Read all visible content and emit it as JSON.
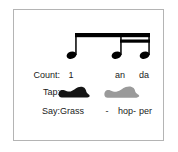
{
  "figure": {
    "border_color": "#b4b4b4",
    "background_color": "#ffffff",
    "ink_color": "#1a1a1a"
  },
  "notation": {
    "type": "beamed-rhythm-group",
    "description": "One eighth note beamed to two sixteenth notes",
    "beam_color": "#000000",
    "notes": [
      {
        "name": "eighth-note",
        "beams": 1,
        "x": 75,
        "label": "1"
      },
      {
        "name": "sixteenth-note",
        "beams": 2,
        "x": 120,
        "label": "an"
      },
      {
        "name": "sixteenth-note",
        "beams": 2,
        "x": 145,
        "label": "da"
      }
    ]
  },
  "rows": {
    "count": {
      "label": "Count:",
      "values": [
        "1",
        "an",
        "da"
      ]
    },
    "tap": {
      "label": "Tap:",
      "shoes": [
        {
          "name": "tap-shoe-black",
          "color": "#141414"
        },
        {
          "name": "tap-shoe-gray",
          "color": "#9a9a9a"
        }
      ]
    },
    "say": {
      "label": "Say:",
      "words": [
        "Grass",
        "-",
        "hop-",
        "per"
      ]
    }
  }
}
